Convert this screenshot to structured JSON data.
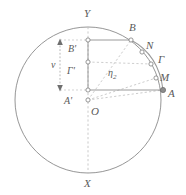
{
  "figure": {
    "kind": "geometric-diagram",
    "background": "#ffffff",
    "stroke_circle": "#8a8a8a",
    "stroke_solid": "#8f8f8f",
    "stroke_dashed": "#b4b4b4",
    "stroke_arc": "#9a9a9a",
    "label_color": "#5a5a5a",
    "node_fill": "#ffffff",
    "node_stroke": "#7d7d7d",
    "width": 186,
    "height": 195,
    "circle": {
      "cx": 88,
      "cy": 100,
      "r": 73
    }
  },
  "labels": [
    {
      "id": "Y",
      "text": "Y",
      "x": 84,
      "y": 8,
      "size": "sz11"
    },
    {
      "id": "B",
      "text": "B",
      "x": 129,
      "y": 22,
      "size": "sz11"
    },
    {
      "id": "N",
      "text": "N",
      "x": 146,
      "y": 40,
      "size": "sz11"
    },
    {
      "id": "Bprime",
      "text": "B'",
      "x": 68,
      "y": 44,
      "size": "sz10"
    },
    {
      "id": "Gamma",
      "text": "Γ",
      "x": 158,
      "y": 54,
      "size": "sz11"
    },
    {
      "id": "v",
      "text": "v",
      "x": 51,
      "y": 60,
      "size": "sz10"
    },
    {
      "id": "Gprime",
      "text": "Γ'",
      "x": 67,
      "y": 66,
      "size": "sz10"
    },
    {
      "id": "M",
      "text": "M",
      "x": 160,
      "y": 72,
      "size": "sz11"
    },
    {
      "id": "A",
      "text": "A",
      "x": 168,
      "y": 88,
      "size": "sz11"
    },
    {
      "id": "Aprime",
      "text": "A'",
      "x": 64,
      "y": 96,
      "size": "sz10"
    },
    {
      "id": "O",
      "text": "O",
      "x": 91,
      "y": 106,
      "size": "sz11"
    },
    {
      "id": "X",
      "text": "X",
      "x": 84,
      "y": 178,
      "size": "sz11"
    }
  ],
  "eta_label": {
    "id": "eta2",
    "base": "η",
    "sub": "2",
    "x": 108,
    "y": 68
  },
  "nodes": [
    {
      "id": "node-Bprime",
      "x": 88,
      "y": 40
    },
    {
      "id": "node-B",
      "x": 131,
      "y": 40
    },
    {
      "id": "node-N",
      "x": 142,
      "y": 52
    },
    {
      "id": "node-Gprime",
      "x": 88,
      "y": 62
    },
    {
      "id": "node-Gamma",
      "x": 151,
      "y": 64
    },
    {
      "id": "node-M",
      "x": 156,
      "y": 78
    },
    {
      "id": "node-Aprime",
      "x": 88,
      "y": 90
    },
    {
      "id": "node-A",
      "x": 163,
      "y": 90
    },
    {
      "id": "node-O",
      "x": 88,
      "y": 100
    }
  ],
  "segments": {
    "solid": [
      {
        "id": "seg-Bprime-B",
        "x1": 88,
        "y1": 40,
        "x2": 131,
        "y2": 40
      },
      {
        "id": "seg-Aprime-A",
        "x1": 88,
        "y1": 90,
        "x2": 163,
        "y2": 90
      },
      {
        "id": "seg-vertical-axis-box",
        "x1": 88,
        "y1": 40,
        "x2": 88,
        "y2": 90
      }
    ],
    "dashed": [
      {
        "id": "seg-Gprime-Gamma",
        "x1": 88,
        "y1": 62,
        "x2": 151,
        "y2": 64
      },
      {
        "id": "seg-O-B",
        "x1": 88,
        "y1": 100,
        "x2": 131,
        "y2": 40
      },
      {
        "id": "seg-O-A",
        "x1": 88,
        "y1": 100,
        "x2": 163,
        "y2": 90
      },
      {
        "id": "seg-O-M",
        "x1": 88,
        "y1": 100,
        "x2": 156,
        "y2": 78
      },
      {
        "id": "seg-YX-axis",
        "x1": 88,
        "y1": 27,
        "x2": 88,
        "y2": 173
      },
      {
        "id": "seg-left-tick-top",
        "x1": 60,
        "y1": 40,
        "x2": 88,
        "y2": 40
      },
      {
        "id": "seg-left-tick-bottom",
        "x1": 60,
        "y1": 90,
        "x2": 88,
        "y2": 90
      }
    ],
    "measure_arrow": {
      "id": "measure-v",
      "x": 60,
      "y1": 40,
      "y2": 90
    }
  },
  "arc": {
    "id": "arc-B-A",
    "from": {
      "x": 131,
      "y": 40
    },
    "to": {
      "x": 163,
      "y": 90
    },
    "ctrl": {
      "x": 159,
      "y": 55
    }
  }
}
